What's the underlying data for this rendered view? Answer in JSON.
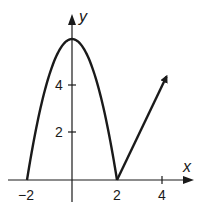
{
  "chart_data": {
    "type": "line",
    "title": "",
    "xlabel": "x",
    "ylabel": "y",
    "xlim": [
      -2.4,
      5.2
    ],
    "ylim": [
      -1.2,
      7.6
    ],
    "grid": false,
    "x_ticks": [
      -2,
      2,
      4
    ],
    "x_tick_labels": [
      "−2",
      "2",
      "4"
    ],
    "y_ticks": [
      2,
      4
    ],
    "y_tick_labels": [
      "2",
      "4"
    ],
    "series": [
      {
        "name": "parabola",
        "description": "downward parabola y = 6 - 1.5x^2 on [-2, 2]",
        "x": [
          -2,
          -1.5,
          -1,
          -0.5,
          0,
          0.5,
          1,
          1.5,
          2
        ],
        "y": [
          0,
          2.625,
          4.5,
          5.625,
          6,
          5.625,
          4.5,
          2.625,
          0
        ],
        "closed_endpoints": false
      },
      {
        "name": "ray",
        "description": "ray y = 2(x - 2) starting at (2, 0) with arrow",
        "x": [
          2,
          4.2
        ],
        "y": [
          0,
          4.4
        ],
        "arrow_end": true
      }
    ]
  }
}
